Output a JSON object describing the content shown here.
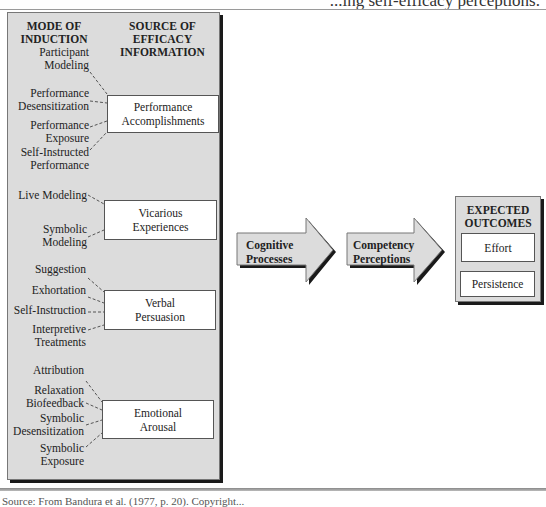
{
  "caption_fragment": "...ing self-efficacy perceptions.",
  "panel": {
    "header_mode": [
      "MODE OF",
      "INDUCTION"
    ],
    "header_source": [
      "SOURCE OF",
      "EFFICACY",
      "INFORMATION"
    ],
    "groups": [
      {
        "source": [
          "Performance",
          "Accomplishments"
        ],
        "modes": [
          [
            "Participant",
            "Modeling"
          ],
          [
            "Performance",
            "Desensitization"
          ],
          [
            "Performance",
            "Exposure"
          ],
          [
            "Self-Instructed",
            "Performance"
          ]
        ]
      },
      {
        "source": [
          "Vicarious",
          "Experiences"
        ],
        "modes": [
          [
            "Live Modeling"
          ],
          [
            "Symbolic",
            "Modeling"
          ]
        ]
      },
      {
        "source": [
          "Verbal",
          "Persuasion"
        ],
        "modes": [
          [
            "Suggestion"
          ],
          [
            "Exhortation"
          ],
          [
            "Self-Instruction"
          ],
          [
            "Interpretive",
            "Treatments"
          ]
        ]
      },
      {
        "source": [
          "Emotional",
          "Arousal"
        ],
        "modes": [
          [
            "Attribution"
          ],
          [
            "Relaxation",
            "Biofeedback"
          ],
          [
            "Symbolic",
            "Desensitization"
          ],
          [
            "Symbolic",
            "Exposure"
          ]
        ]
      }
    ]
  },
  "arrows": [
    {
      "label": [
        "Cognitive",
        "Processes"
      ]
    },
    {
      "label": [
        "Competency",
        "Perceptions"
      ]
    }
  ],
  "outcomes": {
    "title": [
      "EXPECTED",
      "OUTCOMES"
    ],
    "items": [
      "Effort",
      "Persistence"
    ]
  },
  "source_note": "Source: From Bandura et al. (1977, p. 20). Copyright..."
}
